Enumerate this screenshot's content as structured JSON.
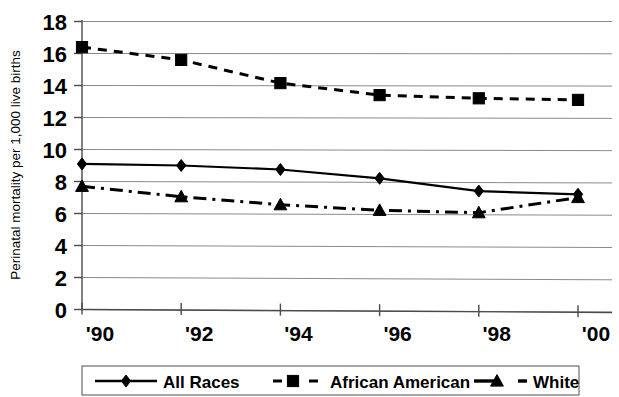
{
  "chart_data": {
    "type": "line",
    "title": "",
    "subtitle": "",
    "xlabel": "",
    "ylabel": "Perinatal mortality per 1,000 live births",
    "categories": [
      "'90",
      "'92",
      "'94",
      "'96",
      "'98",
      "'00"
    ],
    "x": [
      1990,
      1992,
      1994,
      1996,
      1998,
      2000
    ],
    "ylim": [
      0,
      18
    ],
    "xlim": [
      1990,
      2000
    ],
    "y_ticks": [
      "0",
      "2",
      "4",
      "6",
      "8",
      "10",
      "12",
      "14",
      "16",
      "18"
    ],
    "y_tick_values": [
      0,
      2,
      4,
      6,
      8,
      10,
      12,
      14,
      16,
      18
    ],
    "grid": "horizontal",
    "legend_position": "bottom",
    "series": [
      {
        "name": "All Races",
        "marker": "diamond",
        "line_style": "solid",
        "color": "#000000",
        "values": [
          9.1,
          9.0,
          8.75,
          8.2,
          7.4,
          7.2
        ]
      },
      {
        "name": "African American",
        "marker": "square",
        "line_style": "dashed",
        "color": "#000000",
        "values": [
          16.4,
          15.6,
          14.15,
          13.4,
          13.2,
          13.1
        ]
      },
      {
        "name": "White",
        "marker": "triangle",
        "line_style": "dash-dot",
        "color": "#000000",
        "values": [
          7.7,
          7.05,
          6.55,
          6.2,
          6.05,
          7.0
        ]
      }
    ]
  },
  "legend": {
    "items": [
      {
        "label": "All Races",
        "marker": "diamond-marker-icon"
      },
      {
        "label": "African American",
        "marker": "square-marker-icon"
      },
      {
        "label": "White",
        "marker": "triangle-marker-icon"
      }
    ]
  }
}
